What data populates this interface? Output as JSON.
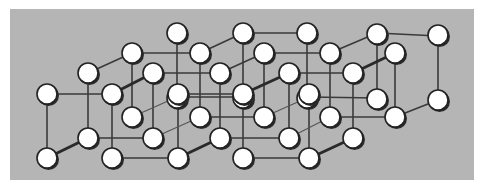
{
  "figure": {
    "title": "",
    "background_color": "#ffffff",
    "panel_color": "#b5b5b5",
    "atom_fill": "#ffffff",
    "atom_stroke": "#222222",
    "bond_color": "#3a3a3a"
  },
  "chart_data": {
    "type": "diagram",
    "kind": "3d-lattice",
    "panel": {
      "x": 10,
      "y": 9,
      "width": 464,
      "height": 171
    },
    "atom_radius": 10,
    "grid": {
      "nx": 5,
      "ny": 2,
      "nz": 4
    },
    "layers": [
      {
        "depth": 0,
        "top_y": 94,
        "bottom_y": 158,
        "x": [
          47,
          112,
          178,
          243,
          309
        ]
      },
      {
        "depth": 1,
        "top_y": 73,
        "bottom_y": 138,
        "x": [
          88,
          153,
          220,
          289,
          353
        ]
      },
      {
        "depth": 2,
        "top_y": 53,
        "bottom_y": 117,
        "x": [
          132,
          200,
          264,
          330,
          395
        ]
      },
      {
        "depth": 3,
        "top_y": 33,
        "bottom_y": 98,
        "x": [
          177,
          243,
          307,
          377,
          438
        ]
      }
    ],
    "bonds_horizontal": [
      [
        47,
        94,
        112,
        94
      ],
      [
        178,
        94,
        243,
        94
      ],
      [
        113,
        158,
        178,
        158
      ],
      [
        243,
        158,
        310,
        158
      ],
      [
        153,
        73,
        220,
        73
      ],
      [
        289,
        73,
        353,
        73
      ],
      [
        88,
        138,
        153,
        138
      ],
      [
        220,
        138,
        289,
        138
      ],
      [
        132,
        53,
        200,
        53
      ],
      [
        264,
        53,
        330,
        53
      ],
      [
        200,
        117,
        264,
        117
      ],
      [
        330,
        117,
        395,
        117
      ],
      [
        243,
        33,
        307,
        33
      ],
      [
        377,
        33,
        438,
        36
      ],
      [
        177,
        97,
        243,
        97
      ],
      [
        309,
        97,
        377,
        98
      ]
    ],
    "bonds_vertical": [
      [
        47,
        94,
        47,
        158
      ],
      [
        112,
        94,
        112,
        158
      ],
      [
        178,
        94,
        178,
        158
      ],
      [
        243,
        94,
        243,
        158
      ],
      [
        309,
        94,
        309,
        158
      ],
      [
        88,
        73,
        88,
        138
      ],
      [
        153,
        73,
        153,
        138
      ],
      [
        220,
        73,
        220,
        138
      ],
      [
        289,
        73,
        289,
        138
      ],
      [
        353,
        73,
        353,
        138
      ],
      [
        132,
        53,
        132,
        117
      ],
      [
        200,
        53,
        200,
        117
      ],
      [
        264,
        53,
        264,
        117
      ],
      [
        330,
        53,
        330,
        117
      ],
      [
        395,
        53,
        395,
        117
      ],
      [
        177,
        33,
        177,
        95
      ],
      [
        243,
        33,
        243,
        95
      ],
      [
        307,
        33,
        307,
        95
      ],
      [
        377,
        33,
        377,
        98
      ],
      [
        438,
        36,
        438,
        100
      ]
    ],
    "bonds_depth": [
      {
        "x1": 47,
        "y1": 158,
        "x2": 88,
        "y2": 138,
        "w": "thick"
      },
      {
        "x1": 112,
        "y1": 94,
        "x2": 153,
        "y2": 73,
        "w": "thick"
      },
      {
        "x1": 88,
        "y1": 73,
        "x2": 132,
        "y2": 53,
        "w": "normal"
      },
      {
        "x1": 200,
        "y1": 53,
        "x2": 243,
        "y2": 33,
        "w": "normal"
      },
      {
        "x1": 220,
        "y1": 73,
        "x2": 264,
        "y2": 53,
        "w": "normal"
      },
      {
        "x1": 132,
        "y1": 117,
        "x2": 177,
        "y2": 97,
        "w": "thin"
      },
      {
        "x1": 153,
        "y1": 138,
        "x2": 200,
        "y2": 117,
        "w": "thin"
      },
      {
        "x1": 178,
        "y1": 158,
        "x2": 220,
        "y2": 138,
        "w": "thick"
      },
      {
        "x1": 243,
        "y1": 94,
        "x2": 289,
        "y2": 73,
        "w": "thick"
      },
      {
        "x1": 264,
        "y1": 117,
        "x2": 309,
        "y2": 97,
        "w": "thin"
      },
      {
        "x1": 330,
        "y1": 53,
        "x2": 377,
        "y2": 33,
        "w": "normal"
      },
      {
        "x1": 289,
        "y1": 138,
        "x2": 330,
        "y2": 117,
        "w": "thin"
      },
      {
        "x1": 310,
        "y1": 158,
        "x2": 353,
        "y2": 138,
        "w": "thick"
      },
      {
        "x1": 353,
        "y1": 73,
        "x2": 395,
        "y2": 53,
        "w": "thick"
      },
      {
        "x1": 395,
        "y1": 117,
        "x2": 438,
        "y2": 100,
        "w": "normal"
      }
    ]
  }
}
